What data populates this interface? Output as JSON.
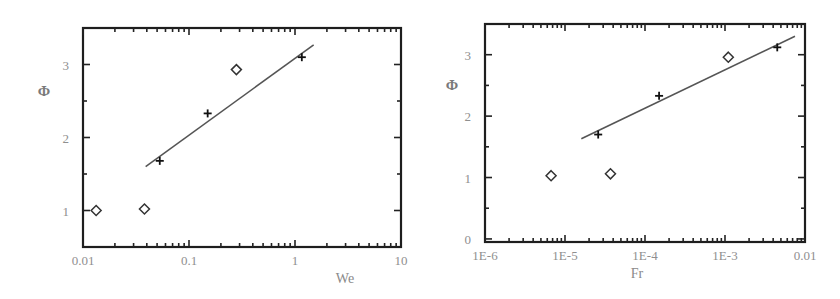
{
  "chart_data": [
    {
      "type": "scatter",
      "title": "",
      "xlabel": "We",
      "ylabel": "Φ",
      "xscale": "log",
      "xlim": [
        0.01,
        10
      ],
      "ylim": [
        0.5,
        3.5
      ],
      "xticks": [
        0.01,
        0.1,
        1,
        10
      ],
      "xtick_labels": [
        "0.01",
        "0.1",
        "1",
        "10"
      ],
      "yticks": [
        1,
        2,
        3
      ],
      "ytick_labels": [
        "1",
        "2",
        "3"
      ],
      "grid": false,
      "legend": null,
      "series": [
        {
          "name": "diamond",
          "marker": "diamond",
          "x": [
            0.0133,
            0.038,
            0.28
          ],
          "y": [
            1.0,
            1.02,
            2.93
          ]
        },
        {
          "name": "plus",
          "marker": "plus",
          "x": [
            0.053,
            0.15,
            1.16
          ],
          "y": [
            1.68,
            2.33,
            3.1
          ]
        },
        {
          "name": "fit",
          "marker": "line",
          "x": [
            0.039,
            1.5
          ],
          "y": [
            1.6,
            3.27
          ]
        }
      ],
      "frame_px": {
        "left": 83,
        "top": 28,
        "right": 401,
        "bottom": 247
      }
    },
    {
      "type": "scatter",
      "title": "",
      "xlabel": "Fr",
      "ylabel": "Φ",
      "xscale": "log",
      "xlim": [
        1e-06,
        0.01
      ],
      "ylim": [
        -0.05,
        3.5
      ],
      "xticks": [
        1e-06,
        1e-05,
        0.0001,
        0.001,
        0.01
      ],
      "xtick_labels": [
        "1E-6",
        "1E-5",
        "1E-4",
        "1E-3",
        "0.01"
      ],
      "yticks": [
        0,
        1,
        2,
        3
      ],
      "ytick_labels": [
        "0",
        "1",
        "2",
        "3"
      ],
      "grid": false,
      "legend": null,
      "series": [
        {
          "name": "diamond",
          "marker": "diamond",
          "x": [
            6.7e-06,
            3.7e-05,
            0.0011
          ],
          "y": [
            1.03,
            1.06,
            2.96
          ]
        },
        {
          "name": "plus",
          "marker": "plus",
          "x": [
            2.6e-05,
            0.00015,
            0.0045
          ],
          "y": [
            1.7,
            2.33,
            3.12
          ]
        },
        {
          "name": "fit",
          "marker": "line",
          "x": [
            1.6e-05,
            0.0075
          ],
          "y": [
            1.63,
            3.3
          ]
        }
      ],
      "frame_px": {
        "left": 485,
        "top": 24,
        "right": 805,
        "bottom": 242
      }
    }
  ],
  "charts": {
    "left": {
      "xlabel": "We",
      "ylabel": "Φ"
    },
    "right": {
      "xlabel": "Fr",
      "ylabel": "Φ"
    }
  }
}
